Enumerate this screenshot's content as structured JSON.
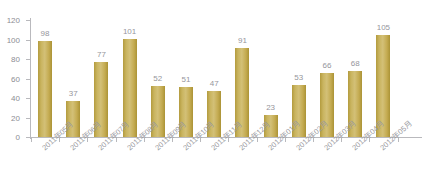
{
  "chart_data": {
    "type": "bar",
    "title": "",
    "xlabel": "",
    "ylabel": "",
    "ylim": [
      0,
      120
    ],
    "yticks": [
      0,
      20,
      40,
      60,
      80,
      100,
      120
    ],
    "grid": false,
    "legend": null,
    "series_color": "#C4AB51",
    "label_color": "#96969C",
    "axis_color": "#B9B9BD",
    "categories": [
      "2011年05月",
      "2011年06月",
      "2011年07月",
      "2011年08月",
      "2011年09月",
      "2011年10月",
      "2011年11月",
      "2011年12月",
      "2012年01月",
      "2012年02月",
      "2012年03月",
      "2012年04月",
      "2012年05月"
    ],
    "values": [
      98,
      37,
      77,
      101,
      52,
      51,
      47,
      91,
      23,
      53,
      66,
      68,
      105
    ]
  }
}
